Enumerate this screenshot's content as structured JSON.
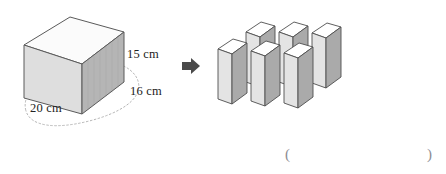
{
  "figure": {
    "background_color": "#ffffff",
    "source_solid": {
      "name": "large-cuboid",
      "labels": {
        "height": "15 cm",
        "depth": "16 cm",
        "width": "20 cm"
      },
      "dimensions": {
        "height_cm": 15,
        "depth_cm": 16,
        "width_cm": 20
      },
      "faces": {
        "top_fill": "#fbfbfb",
        "front_fill": "#dcdcdc",
        "side_fill": "#b4b4b4",
        "stroke": "#5a5a5a"
      },
      "guide_curve": {
        "name": "dotted-ellipse-guide",
        "stroke": "#b0b0b0",
        "dash": "1.6 2.4"
      }
    },
    "transform_arrow": {
      "name": "right-arrow",
      "glyph": "➜",
      "color": "#4a4a4a"
    },
    "result_solid": {
      "name": "six-small-blocks",
      "count": 6,
      "rows": 2,
      "columns": 3,
      "faces": {
        "top_fill": "#ffffff",
        "front_fill": "#e2e2e2",
        "side_fill": "#a9a9a9",
        "stroke": "#4e4e4e"
      },
      "blocks": [
        {
          "name": "block-back-left",
          "row": "back",
          "x": 253,
          "y": 22
        },
        {
          "name": "block-back-middle",
          "row": "back",
          "x": 285,
          "y": 22
        },
        {
          "name": "block-back-right",
          "row": "back",
          "x": 312,
          "y": 23
        },
        {
          "name": "block-front-left",
          "row": "front",
          "x": 218,
          "y": 38
        },
        {
          "name": "block-front-middle",
          "row": "front",
          "x": 251,
          "y": 40
        },
        {
          "name": "block-front-right",
          "row": "front",
          "x": 284,
          "y": 42
        }
      ]
    },
    "answer_blank": {
      "name": "answer-parentheses",
      "open": "(",
      "close": ")",
      "value": ""
    }
  }
}
